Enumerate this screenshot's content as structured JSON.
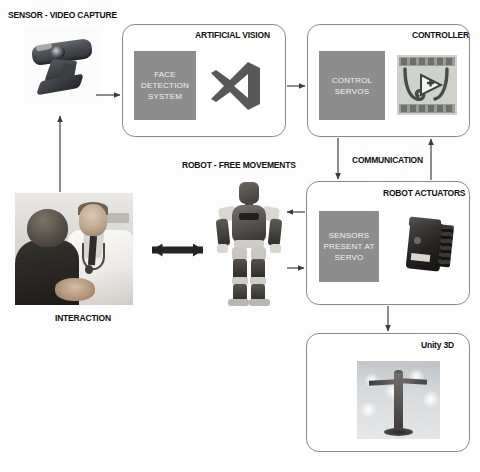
{
  "diagram": {
    "type": "block-diagram",
    "background_color": "#fdfdfd",
    "box_border_color": "#8a8a8a",
    "inner_block_color": "#8d8d8d",
    "inner_block_text_color": "#f2f2f2",
    "arrow_color": "#3a3a3a",
    "label_color": "#111111"
  },
  "labels": {
    "sensor_video_capture": "SENSOR - VIDEO CAPTURE",
    "artificial_vision": "ARTIFICIAL VISION",
    "controller": "CONTROLLER",
    "communication": "COMMUNICATION",
    "robot_actuators": "ROBOT ACTUATORS",
    "robot_free_movements": "ROBOT - FREE MOVEMENTS",
    "interaction": "INTERACTION",
    "unity_3d": "Unity 3D"
  },
  "blocks": {
    "face_detection_system": "FACE\nDETECTION\nSYSTEM",
    "face_detection_lines": [
      "FACE",
      "DETECTION",
      "SYSTEM"
    ],
    "control_servos_lines": [
      "CONTROL",
      "SERVOS"
    ],
    "sensors_present_at_servo_lines": [
      "SENSORS",
      "PRESENT AT",
      "SERVO"
    ]
  },
  "images": {
    "webcam": "webcam-photo",
    "visual_studio_logo": "visual-studio-logo-icon",
    "labview_logo": "labview-logo-icon",
    "doctor_patient": "doctor-patient-interaction-photo",
    "humanoid_robot": "humanoid-robot-photo",
    "servo_motor": "servo-motor-photo",
    "unity_scene": "unity-3d-scene-screenshot"
  },
  "connections": [
    {
      "from": "sensor-video-capture",
      "to": "artificial-vision",
      "style": "single"
    },
    {
      "from": "artificial-vision",
      "to": "controller",
      "style": "single"
    },
    {
      "from": "controller",
      "to": "robot-actuators",
      "style": "single-down"
    },
    {
      "from": "robot-actuators",
      "to": "controller",
      "style": "single-up"
    },
    {
      "from": "robot-actuators",
      "to": "robot-free-movements",
      "style": "single-left"
    },
    {
      "from": "robot-free-movements",
      "to": "robot-actuators",
      "style": "single-right"
    },
    {
      "from": "interaction",
      "to": "robot-free-movements",
      "style": "double"
    },
    {
      "from": "interaction",
      "to": "sensor-video-capture",
      "style": "single-up"
    },
    {
      "from": "robot-actuators",
      "to": "unity-3d",
      "style": "single-down"
    }
  ]
}
